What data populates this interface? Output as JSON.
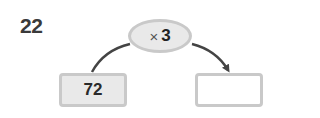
{
  "problem": {
    "number": "22",
    "operation": {
      "symbol": "×",
      "operand": "3"
    },
    "input_value": "72",
    "output_value": ""
  },
  "colors": {
    "fill_gray": "#e9e9e9",
    "border_gray": "#c9c9c9",
    "arrow": "#444444",
    "text": "#2a2a2a"
  }
}
